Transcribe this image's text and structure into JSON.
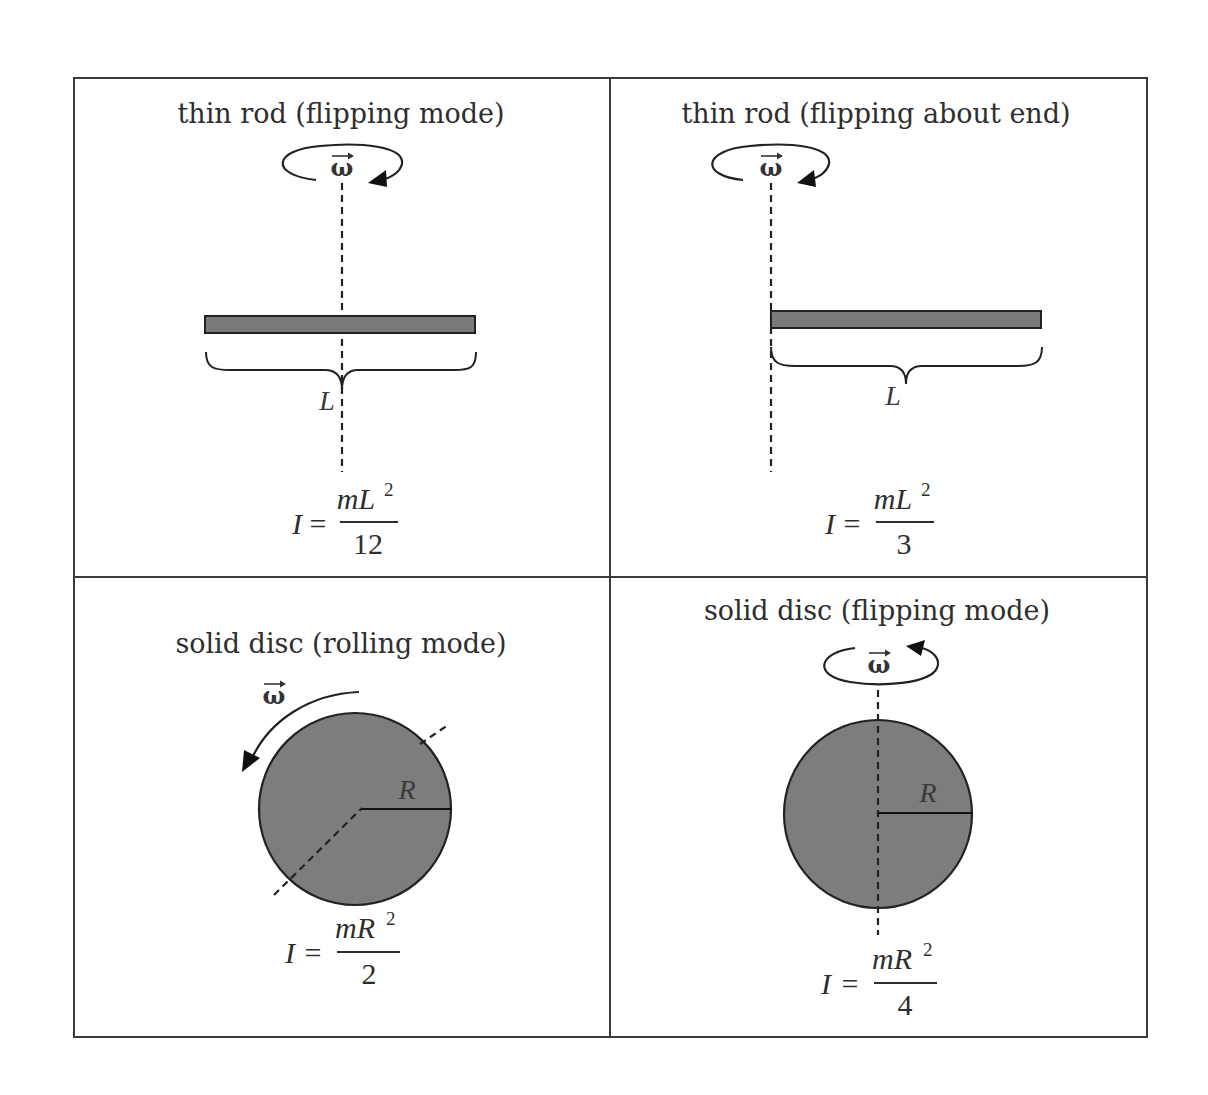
{
  "figure": {
    "colors": {
      "grid_line": "#3a3a3a",
      "body_fill": "#7a7a7a",
      "outline": "#222222",
      "text": "#2e2e2e",
      "background": "#ffffff"
    },
    "symbols": {
      "omega": "ω",
      "omega_arrow": "→",
      "equals": "="
    },
    "panels": [
      {
        "id": "thin-rod-center",
        "title": "thin rod (flipping mode)",
        "length_label": "L",
        "formula": {
          "lhs": "I",
          "numerator_m": "m",
          "numerator_var": "L",
          "exponent": "2",
          "denominator": "12"
        }
      },
      {
        "id": "thin-rod-end",
        "title": "thin rod (flipping about end)",
        "length_label": "L",
        "formula": {
          "lhs": "I",
          "numerator_m": "m",
          "numerator_var": "L",
          "exponent": "2",
          "denominator": "3"
        }
      },
      {
        "id": "solid-disc-rolling",
        "title": "solid disc (rolling mode)",
        "radius_label": "R",
        "formula": {
          "lhs": "I",
          "numerator_m": "m",
          "numerator_var": "R",
          "exponent": "2",
          "denominator": "2"
        }
      },
      {
        "id": "solid-disc-flipping",
        "title": "solid disc (flipping mode)",
        "radius_label": "R",
        "formula": {
          "lhs": "I",
          "numerator_m": "m",
          "numerator_var": "R",
          "exponent": "2",
          "denominator": "4"
        }
      }
    ]
  }
}
